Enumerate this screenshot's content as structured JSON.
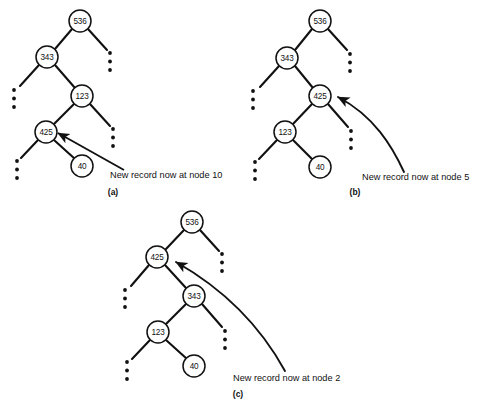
{
  "figure": {
    "background_color": "#ffffff",
    "ink_color": "#111111"
  },
  "panels": [
    {
      "id": "a",
      "letter": "(a)",
      "letter_pos": {
        "x": 113,
        "y": 195
      },
      "annotation": {
        "text": "New record now at node 10",
        "x": 110,
        "y": 178,
        "arrow_type": "straight",
        "arrow_from": {
          "x": 124,
          "y": 170
        },
        "arrow_to": {
          "x": 58,
          "y": 133
        }
      },
      "nodes": [
        {
          "label": "536",
          "x": 80,
          "y": 21,
          "r": 11
        },
        {
          "label": "343",
          "x": 47,
          "y": 57,
          "r": 11
        },
        {
          "label": "123",
          "x": 82,
          "y": 96,
          "r": 11
        },
        {
          "label": "425",
          "x": 46,
          "y": 132,
          "r": 11
        },
        {
          "label": "40",
          "x": 82,
          "y": 166,
          "r": 11
        }
      ],
      "edges": [
        {
          "from": {
            "x": 72,
            "y": 29
          },
          "to": {
            "x": 55,
            "y": 49
          }
        },
        {
          "from": {
            "x": 88,
            "y": 29
          },
          "to": {
            "x": 107,
            "y": 50
          }
        },
        {
          "from": {
            "x": 39,
            "y": 65
          },
          "to": {
            "x": 20,
            "y": 86
          }
        },
        {
          "from": {
            "x": 55,
            "y": 65
          },
          "to": {
            "x": 75,
            "y": 88
          }
        },
        {
          "from": {
            "x": 74,
            "y": 104
          },
          "to": {
            "x": 54,
            "y": 124
          }
        },
        {
          "from": {
            "x": 90,
            "y": 104
          },
          "to": {
            "x": 110,
            "y": 126
          }
        },
        {
          "from": {
            "x": 38,
            "y": 140
          },
          "to": {
            "x": 21,
            "y": 158
          }
        },
        {
          "from": {
            "x": 54,
            "y": 140
          },
          "to": {
            "x": 75,
            "y": 159
          }
        }
      ],
      "ellipses": [
        {
          "x": 110,
          "y": 53
        },
        {
          "x": 14,
          "y": 90
        },
        {
          "x": 113,
          "y": 129
        },
        {
          "x": 17,
          "y": 161
        }
      ]
    },
    {
      "id": "b",
      "letter": "(b)",
      "letter_pos": {
        "x": 355,
        "y": 195
      },
      "annotation": {
        "text": "New record now at node 5",
        "x": 362,
        "y": 180,
        "arrow_type": "curve",
        "curve_path": "M 404,172 C 392,146 374,116 338,97",
        "arrow_to": {
          "x": 333,
          "y": 95
        }
      },
      "nodes": [
        {
          "label": "536",
          "x": 320,
          "y": 21,
          "r": 11
        },
        {
          "label": "343",
          "x": 287,
          "y": 58,
          "r": 11
        },
        {
          "label": "425",
          "x": 320,
          "y": 96,
          "r": 11
        },
        {
          "label": "123",
          "x": 285,
          "y": 132,
          "r": 11
        },
        {
          "label": "40",
          "x": 320,
          "y": 167,
          "r": 11
        }
      ],
      "edges": [
        {
          "from": {
            "x": 312,
            "y": 29
          },
          "to": {
            "x": 295,
            "y": 50
          }
        },
        {
          "from": {
            "x": 328,
            "y": 29
          },
          "to": {
            "x": 347,
            "y": 50
          }
        },
        {
          "from": {
            "x": 279,
            "y": 66
          },
          "to": {
            "x": 260,
            "y": 87
          }
        },
        {
          "from": {
            "x": 295,
            "y": 66
          },
          "to": {
            "x": 313,
            "y": 88
          }
        },
        {
          "from": {
            "x": 312,
            "y": 104
          },
          "to": {
            "x": 293,
            "y": 124
          }
        },
        {
          "from": {
            "x": 328,
            "y": 104
          },
          "to": {
            "x": 348,
            "y": 127
          }
        },
        {
          "from": {
            "x": 277,
            "y": 140
          },
          "to": {
            "x": 259,
            "y": 159
          }
        },
        {
          "from": {
            "x": 293,
            "y": 140
          },
          "to": {
            "x": 313,
            "y": 160
          }
        }
      ],
      "ellipses": [
        {
          "x": 350,
          "y": 54
        },
        {
          "x": 253,
          "y": 91
        },
        {
          "x": 351,
          "y": 131
        },
        {
          "x": 255,
          "y": 162
        }
      ]
    },
    {
      "id": "c",
      "letter": "(c)",
      "letter_pos": {
        "x": 238,
        "y": 397
      },
      "annotation": {
        "text": "New record now at node 2",
        "x": 233,
        "y": 381,
        "arrow_type": "curve",
        "curve_path": "M 285,371 C 268,340 236,296 176,262",
        "arrow_to": {
          "x": 170,
          "y": 259
        }
      },
      "nodes": [
        {
          "label": "536",
          "x": 192,
          "y": 222,
          "r": 11
        },
        {
          "label": "425",
          "x": 157,
          "y": 257,
          "r": 11
        },
        {
          "label": "343",
          "x": 194,
          "y": 296,
          "r": 11
        },
        {
          "label": "123",
          "x": 158,
          "y": 332,
          "r": 11
        },
        {
          "label": "40",
          "x": 194,
          "y": 366,
          "r": 11
        }
      ],
      "edges": [
        {
          "from": {
            "x": 184,
            "y": 230
          },
          "to": {
            "x": 166,
            "y": 249
          }
        },
        {
          "from": {
            "x": 200,
            "y": 230
          },
          "to": {
            "x": 219,
            "y": 251
          }
        },
        {
          "from": {
            "x": 149,
            "y": 265
          },
          "to": {
            "x": 131,
            "y": 286
          }
        },
        {
          "from": {
            "x": 165,
            "y": 265
          },
          "to": {
            "x": 186,
            "y": 288
          }
        },
        {
          "from": {
            "x": 186,
            "y": 304
          },
          "to": {
            "x": 166,
            "y": 324
          }
        },
        {
          "from": {
            "x": 202,
            "y": 304
          },
          "to": {
            "x": 222,
            "y": 327
          }
        },
        {
          "from": {
            "x": 150,
            "y": 340
          },
          "to": {
            "x": 132,
            "y": 359
          }
        },
        {
          "from": {
            "x": 166,
            "y": 340
          },
          "to": {
            "x": 187,
            "y": 359
          }
        }
      ],
      "ellipses": [
        {
          "x": 222,
          "y": 254
        },
        {
          "x": 125,
          "y": 290
        },
        {
          "x": 225,
          "y": 331
        },
        {
          "x": 127,
          "y": 362
        }
      ]
    }
  ]
}
